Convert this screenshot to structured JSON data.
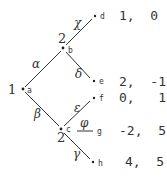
{
  "tree": {
    "nodes": {
      "a": {
        "label": "a",
        "player": "1"
      },
      "b": {
        "label": "b",
        "player": "2"
      },
      "c": {
        "label": "c",
        "player": "2"
      },
      "d": {
        "label": "d",
        "payoff": "1,  0"
      },
      "e": {
        "label": "e",
        "payoff": "2,  -1"
      },
      "f": {
        "label": "f",
        "payoff": "0,   1"
      },
      "g": {
        "label": "g",
        "payoff": "-2,  5"
      },
      "h": {
        "label": "h",
        "payoff": "4,  5"
      }
    },
    "edges": {
      "a_b": {
        "action": "α"
      },
      "a_c": {
        "action": "β"
      },
      "b_d": {
        "action": "χ"
      },
      "b_e": {
        "action": "δ"
      },
      "c_f": {
        "action": "ε"
      },
      "c_g": {
        "action": "φ"
      },
      "c_h": {
        "action": "γ"
      }
    }
  }
}
